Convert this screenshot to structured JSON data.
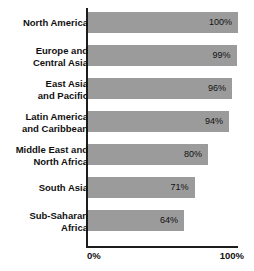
{
  "chart_data": {
    "type": "bar",
    "orientation": "horizontal",
    "title": "",
    "subtitle": "",
    "xlabel": "",
    "ylabel": "",
    "xlim": [
      0,
      100
    ],
    "grid": false,
    "legend": false,
    "bar_color": "#9b9b9b",
    "axis_color": "#1c1c1c",
    "categories": [
      "North America",
      "Europe and\nCentral Asia",
      "East Asia\nand Pacific",
      "Latin America\nand Caribbean",
      "Middle East and\nNorth Africa",
      "South Asia",
      "Sub-Saharan\nAfrica"
    ],
    "values": [
      100,
      99,
      96,
      94,
      80,
      71,
      64
    ],
    "value_labels": [
      "100%",
      "99%",
      "96%",
      "94%",
      "80%",
      "71%",
      "64%"
    ],
    "tick_labels": [
      "0%",
      "100%"
    ],
    "tick_values": [
      0,
      100
    ]
  },
  "axis": {
    "min_label": "0%",
    "max_label": "100%"
  },
  "rows": [
    {
      "label": "North America",
      "value": 100,
      "value_label": "100%",
      "lines": 1
    },
    {
      "label": "Europe and\nCentral Asia",
      "value": 99,
      "value_label": "99%",
      "lines": 2
    },
    {
      "label": "East Asia\nand Pacific",
      "value": 96,
      "value_label": "96%",
      "lines": 2
    },
    {
      "label": "Latin America\nand Caribbean",
      "value": 94,
      "value_label": "94%",
      "lines": 2
    },
    {
      "label": "Middle East and\nNorth Africa",
      "value": 80,
      "value_label": "80%",
      "lines": 2
    },
    {
      "label": "South Asia",
      "value": 71,
      "value_label": "71%",
      "lines": 1
    },
    {
      "label": "Sub-Saharan\nAfrica",
      "value": 64,
      "value_label": "64%",
      "lines": 2
    }
  ]
}
